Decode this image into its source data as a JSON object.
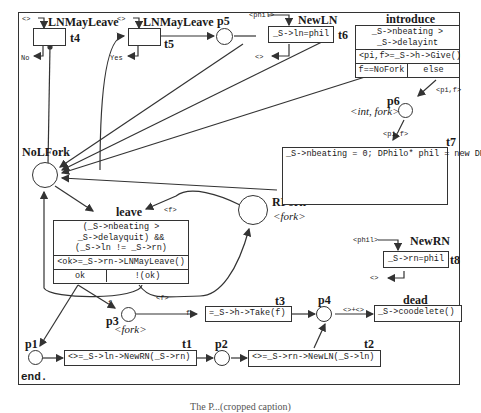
{
  "diagram": {
    "type": "petri-net",
    "end_label": "end.",
    "caption": "The P...(cropped caption)",
    "places": {
      "nolfork": {
        "name": "NoLFork"
      },
      "rfork": {
        "name": "RFork",
        "type": "<fork>"
      },
      "p1": {
        "name": "p1"
      },
      "p2": {
        "name": "p2"
      },
      "p3": {
        "name": "p3",
        "type": "<fork>"
      },
      "p4": {
        "name": "p4"
      },
      "p5": {
        "name": "p5"
      },
      "p6": {
        "name": "p6",
        "type": "<int, fork>"
      }
    },
    "transitions": {
      "t4": {
        "name": "LNMayLeave",
        "id": "t4",
        "in_arc": "<>",
        "out_arc": "No"
      },
      "t5": {
        "name": "LNMayLeave",
        "id": "t5",
        "in_arc": "<>",
        "out_arc": "Yes"
      },
      "t6": {
        "name": "NewLN",
        "id": "t6",
        "in_arc": "<phil>",
        "out_arc": "<>",
        "body": "_S->ln=phil"
      },
      "introduce": {
        "name": "introduce",
        "guard_line1": "_S->nbeating >",
        "guard_line2": "_S->delayint",
        "action": "<pi,f>=_S->h->Give()",
        "branch_left": "f==NoFork",
        "branch_right": "else",
        "out_arc": "<pi,f>"
      },
      "t7": {
        "name": "t7",
        "in_arc": "<pi,f>",
        "code": "_S->nbeating = 0;\nDPhilo* phil = new DPhilo;\n<> = _S->ln->NewRN(phil);\nphil->Init(pi,_S->ln,_S,f,_S->h);\n_S->ln = phil;"
      },
      "leave": {
        "name": "leave",
        "in_arc": "<f>",
        "guard_line1": "(_S->nbeating >",
        "guard_line2": "_S->delayquit) &&",
        "guard_line3": "(_S->ln != _S->rn)",
        "action": "<ok>=_S->rn->LNMayLeave()",
        "branch_left": "ok",
        "branch_right": "!(ok)",
        "out_arc_rfork": "<f>",
        "out_arc_p3": "f"
      },
      "t8": {
        "name": "NewRN",
        "id": "t8",
        "in_arc": "<phil>",
        "out_arc": "<>",
        "body": "_S->rn=phil"
      },
      "t3": {
        "name": "t3",
        "in_arc": "f",
        "body": "=_S->h->Take(f)"
      },
      "t1": {
        "name": "t1",
        "body": "<>=_S->ln->NewRN(_S->rn)"
      },
      "t2": {
        "name": "t2",
        "body": "<>=_S->rn->NewLN(_S->ln)"
      },
      "dead": {
        "name": "dead",
        "in_arc": "<>+<>",
        "body": "_S->coodelete()"
      }
    },
    "colors": {
      "stroke": "#333333",
      "background": "#ffffff",
      "text": "#1a1a1a"
    }
  }
}
